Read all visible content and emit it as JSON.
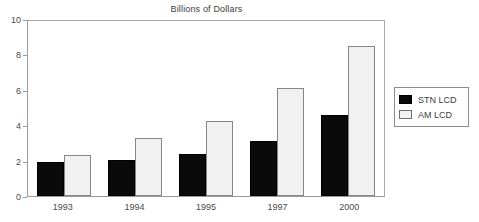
{
  "chart_data": {
    "type": "bar",
    "title": "Billions of Dollars",
    "xlabel": "",
    "ylabel": "",
    "ylim": [
      0,
      10
    ],
    "yticks": [
      0,
      2,
      4,
      6,
      8,
      10
    ],
    "ytick_labels": [
      "0",
      "2",
      "4",
      "6",
      "8",
      "10"
    ],
    "grid": false,
    "legend_position": "right",
    "categories": [
      "1993",
      "1994",
      "1995",
      "1997",
      "2000"
    ],
    "series": [
      {
        "name": "STN LCD",
        "color": "#0a0a0a",
        "values": [
          1.95,
          2.05,
          2.4,
          3.1,
          4.6
        ]
      },
      {
        "name": "AM LCD",
        "color": "#f1f1f1",
        "values": [
          2.3,
          3.25,
          4.25,
          6.1,
          8.5
        ]
      }
    ]
  },
  "legend": {
    "items": [
      {
        "label": "STN LCD",
        "swatch": "black-filled-square"
      },
      {
        "label": "AM LCD",
        "swatch": "white-filled-square"
      }
    ]
  }
}
